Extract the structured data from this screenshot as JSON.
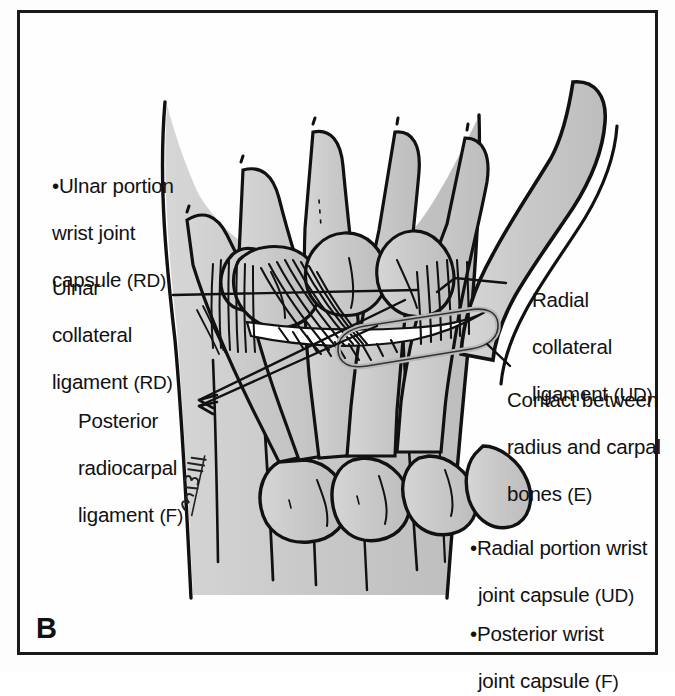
{
  "figure": {
    "panel_letter": "B",
    "view": "posterior wrist joint",
    "frame_color": "#1a1a1a",
    "bone_fill_color": "#c8c8c8",
    "outline_color": "#111111",
    "background_color": "#fefefe",
    "signature": "Bruskis"
  },
  "labels": {
    "ulnar_portion_capsule": {
      "bullet": "•",
      "line1": "Ulnar portion",
      "line2": "wrist joint",
      "line3": "capsule ",
      "code": "(RD)"
    },
    "ulnar_collateral_ligament": {
      "line1": "Ulnar",
      "line2": "collateral",
      "line3": "ligament ",
      "code": "(RD)"
    },
    "posterior_radiocarpal_ligament": {
      "line1": "Posterior",
      "line2": "radiocarpal",
      "line3": "ligament ",
      "code": "(F)"
    },
    "radial_collateral_ligament": {
      "line1": "Radial",
      "line2": "collateral",
      "line3": "ligament ",
      "code": "(UD)"
    },
    "contact_radius_carpal": {
      "line1": "Contact between",
      "line2": "radius and carpal",
      "line3": "bones ",
      "code": "(E)"
    },
    "radial_portion_capsule": {
      "bullet": "•",
      "line1": "Radial portion wrist",
      "line2": "joint capsule ",
      "code": "(UD)"
    },
    "posterior_wrist_capsule": {
      "bullet": "•",
      "line1": "Posterior wrist",
      "line2": "joint capsule ",
      "code": "(F)"
    }
  },
  "anatomy": {
    "structures": [
      "metacarpals",
      "carpal bones",
      "radius",
      "ulna",
      "thumb metacarpal",
      "posterior radiocarpal ligament fibers",
      "ulnar collateral ligament fibers",
      "radial collateral ligament fibers",
      "radiocarpal contact zone"
    ]
  }
}
